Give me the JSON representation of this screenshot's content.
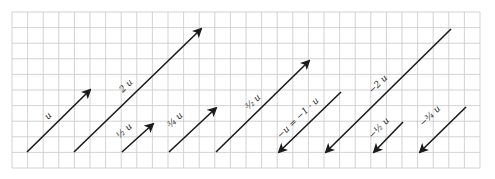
{
  "diagram": {
    "grid": {
      "x0": 12,
      "y0": 12,
      "cell": 15.6,
      "cols": 30,
      "rows": 10,
      "line_color": "#c8c8c8",
      "border_color": "#bdbdbd"
    },
    "vector_color": "#1a1a1a",
    "vectors": [
      {
        "id": "u",
        "label": "u",
        "coef": "1",
        "x1": 27,
        "y1": 152,
        "x2": 90,
        "y2": 90,
        "lx": 50,
        "ly": 118
      },
      {
        "id": "2u",
        "label": "2 u",
        "coef": "2",
        "x1": 74,
        "y1": 152,
        "x2": 201,
        "y2": 29,
        "lx": 128,
        "ly": 88
      },
      {
        "id": "half-u",
        "label": "½ u",
        "coef": "1/2",
        "x1": 122,
        "y1": 152,
        "x2": 153,
        "y2": 124,
        "lx": 126,
        "ly": 133
      },
      {
        "id": "3quarter-u",
        "label": "¾ u",
        "coef": "3/4",
        "x1": 169,
        "y1": 152,
        "x2": 216,
        "y2": 108,
        "lx": 177,
        "ly": 122
      },
      {
        "id": "3half-u",
        "label": "³⁄₂ u",
        "coef": "3/2",
        "x1": 216,
        "y1": 152,
        "x2": 309,
        "y2": 61,
        "lx": 255,
        "ly": 104
      },
      {
        "id": "neg-u",
        "label": "−u = −1 · u",
        "coef": "-1",
        "x1": 341,
        "y1": 92,
        "x2": 279,
        "y2": 152,
        "lx": 300,
        "ly": 120
      },
      {
        "id": "neg-2u",
        "label": "−2 u",
        "coef": "-2",
        "x1": 451,
        "y1": 29,
        "x2": 326,
        "y2": 152,
        "lx": 380,
        "ly": 86
      },
      {
        "id": "neg-half-u",
        "label": "−½ u",
        "coef": "-1/2",
        "x1": 403,
        "y1": 122,
        "x2": 374,
        "y2": 152,
        "lx": 381,
        "ly": 130
      },
      {
        "id": "neg-3quarter-u",
        "label": "−¾ u",
        "coef": "-3/4",
        "x1": 466,
        "y1": 107,
        "x2": 420,
        "y2": 152,
        "lx": 432,
        "ly": 118
      }
    ]
  }
}
